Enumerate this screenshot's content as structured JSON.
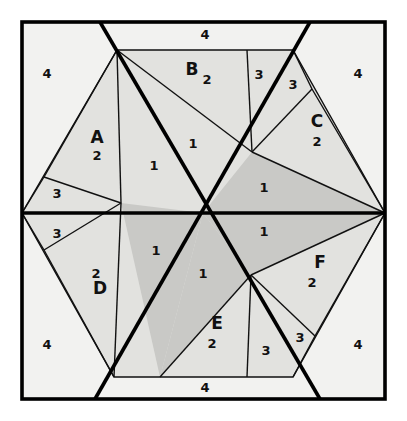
{
  "figure": {
    "colors": {
      "background": "#ffffff",
      "outer_fill": "#f2f2f0",
      "hexagon_fill": "#e2e2df",
      "highlight_fill": "#c9c9c6",
      "stroke": "#111111",
      "thick_stroke": "#000000",
      "text": "#111111"
    },
    "canvas": {
      "width": 407,
      "height": 421
    }
  },
  "labels": {
    "regions": [
      {
        "id": "A",
        "letter": "A",
        "value": "2",
        "lx": 97,
        "ly": 143,
        "vx": 97,
        "vy": 160
      },
      {
        "id": "B",
        "letter": "B",
        "value": "2",
        "lx": 192,
        "ly": 75,
        "vx": 207,
        "vy": 84
      },
      {
        "id": "C",
        "letter": "C",
        "value": "2",
        "lx": 317,
        "ly": 127,
        "vx": 317,
        "vy": 146
      },
      {
        "id": "D",
        "letter": "D",
        "value": "2",
        "lx": 100,
        "ly": 294,
        "vx": 96,
        "vy": 278
      },
      {
        "id": "E",
        "letter": "E",
        "value": "2",
        "lx": 217,
        "ly": 329,
        "vx": 212,
        "vy": 348
      },
      {
        "id": "F",
        "letter": "F",
        "value": "2",
        "lx": 320,
        "ly": 268,
        "vx": 312,
        "vy": 287
      }
    ],
    "corner_fours": [
      {
        "id": "corner-top-left",
        "text": "4",
        "x": 47,
        "y": 78
      },
      {
        "id": "corner-top-right",
        "text": "4",
        "x": 358,
        "y": 78
      },
      {
        "id": "corner-bottom-left",
        "text": "4",
        "x": 47,
        "y": 349
      },
      {
        "id": "corner-bottom-right",
        "text": "4",
        "x": 358,
        "y": 349
      }
    ],
    "edge_fours": [
      {
        "id": "edge-top",
        "text": "4",
        "x": 205,
        "y": 39
      },
      {
        "id": "edge-bottom",
        "text": "4",
        "x": 205,
        "y": 392
      }
    ],
    "ones": [
      {
        "id": "one-upper-mid",
        "text": "1",
        "x": 193,
        "y": 148
      },
      {
        "id": "one-upper-left",
        "text": "1",
        "x": 154,
        "y": 170
      },
      {
        "id": "one-right-upper",
        "text": "1",
        "x": 264,
        "y": 192
      },
      {
        "id": "one-right-lower",
        "text": "1",
        "x": 264,
        "y": 236
      },
      {
        "id": "one-lower-left",
        "text": "1",
        "x": 156,
        "y": 255
      },
      {
        "id": "one-lower-mid",
        "text": "1",
        "x": 203,
        "y": 278
      }
    ],
    "threes": [
      {
        "id": "three-left-upper",
        "text": "3",
        "x": 57,
        "y": 198
      },
      {
        "id": "three-left-lower",
        "text": "3",
        "x": 57,
        "y": 238
      },
      {
        "id": "three-top-right-a",
        "text": "3",
        "x": 259,
        "y": 79
      },
      {
        "id": "three-top-right-b",
        "text": "3",
        "x": 293,
        "y": 89
      },
      {
        "id": "three-bot-right-a",
        "text": "3",
        "x": 266,
        "y": 355
      },
      {
        "id": "three-bot-right-b",
        "text": "3",
        "x": 300,
        "y": 342
      }
    ]
  },
  "geometry": {
    "outer_square": {
      "x": 22,
      "y": 22,
      "w": 363,
      "h": 377
    },
    "center": {
      "x": 203,
      "y": 213
    },
    "hexagon": [
      {
        "name": "top-left",
        "x": 117,
        "y": 50
      },
      {
        "name": "top-right",
        "x": 293,
        "y": 50
      },
      {
        "name": "right",
        "x": 385,
        "y": 213
      },
      {
        "name": "bottom-right",
        "x": 293,
        "y": 377
      },
      {
        "name": "bottom-left",
        "x": 114,
        "y": 377
      },
      {
        "name": "left",
        "x": 22,
        "y": 213
      }
    ],
    "node_top_cut": {
      "x": 247,
      "y": 50
    },
    "node_bot_cut": {
      "x": 160,
      "y": 377
    },
    "node_ne": {
      "x": 252,
      "y": 152
    },
    "node_sw": {
      "x": 251,
      "y": 275
    },
    "node_a_apex": {
      "x": 121,
      "y": 203
    },
    "node_left_a": {
      "x": 44,
      "y": 177
    },
    "node_left_b": {
      "x": 44,
      "y": 250
    },
    "node_c_top": {
      "x": 312,
      "y": 89
    },
    "node_f_bot": {
      "x": 315,
      "y": 336
    },
    "node_e_right": {
      "x": 247,
      "y": 377
    },
    "node_right_in": {
      "x": 385,
      "y": 213
    }
  }
}
